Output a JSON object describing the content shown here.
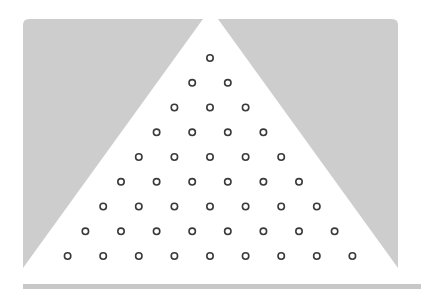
{
  "game": {
    "name": "plinko-peg-board",
    "colors": {
      "background": "#ffffff",
      "wall": "#cdcdcd",
      "peg_stroke": "#3a3a3a",
      "peg_fill": "#ffffff",
      "floor": "#c8c8c8"
    },
    "walls": {
      "left": [
        [
          23,
          22
        ],
        [
          203,
          19
        ],
        [
          23,
          268
        ]
      ],
      "right": [
        [
          218,
          19
        ],
        [
          398,
          19
        ],
        [
          398,
          268
        ]
      ]
    },
    "pegs": {
      "apex_x": 210,
      "apex_y": 58,
      "dx": 35.6,
      "dy": 24.75,
      "rows": 9,
      "radius": 3.2
    }
  }
}
